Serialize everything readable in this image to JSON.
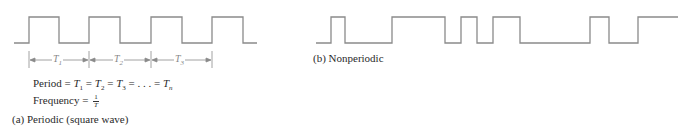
{
  "periodic": {
    "caption": "(a) Periodic (square wave)",
    "period_label_prefix": "Period",
    "period_terms": [
      "T",
      "T",
      "T",
      ". . .",
      "T"
    ],
    "period_subs": [
      "1",
      "2",
      "3",
      "",
      "n"
    ],
    "equals": "=",
    "frequency_label": "Frequency =",
    "frequency_num": "1",
    "frequency_den": "T",
    "interval_labels": [
      {
        "sym": "T",
        "sub": "1"
      },
      {
        "sym": "T",
        "sub": "2"
      },
      {
        "sym": "T",
        "sub": "3"
      }
    ],
    "waveform": {
      "baseline_y": 43,
      "high_y": 17,
      "points_x": [
        14,
        29,
        59,
        89,
        120,
        151,
        182,
        212,
        243,
        257
      ],
      "start_level": "low"
    }
  },
  "nonperiodic": {
    "caption": "(b) Nonperiodic",
    "waveform": {
      "baseline_y": 43,
      "high_y": 17,
      "points_x": [
        316,
        331,
        345,
        392,
        445,
        461,
        477,
        493,
        520,
        590,
        609,
        638,
        678
      ],
      "start_level": "low"
    }
  },
  "colors": {
    "line": "#8a8a8a",
    "text": "#2a2a2a"
  }
}
